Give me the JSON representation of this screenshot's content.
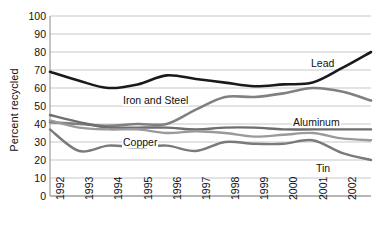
{
  "chart_data": {
    "type": "line",
    "title": "",
    "xlabel": "",
    "ylabel": "Percent recycled",
    "categories": [
      "1992",
      "1993",
      "1994",
      "1995",
      "1996",
      "1997",
      "1998",
      "1999",
      "2000",
      "2001",
      "2002",
      "2003"
    ],
    "x": [
      1992,
      1993,
      1994,
      1995,
      1996,
      1997,
      1998,
      1999,
      2000,
      2001,
      2002,
      2003
    ],
    "ylim": [
      0,
      100
    ],
    "ytick_step": 10,
    "yticks": [
      "100",
      "90",
      "80",
      "70",
      "60",
      "50",
      "40",
      "30",
      "20",
      "10",
      "0"
    ],
    "grid": "horizontal",
    "legend_position": "inline-annotations",
    "series": [
      {
        "name": "Lead",
        "color": "#1a1a1a",
        "width": 2.6,
        "values": [
          69,
          64,
          60,
          62,
          67,
          65,
          63,
          61,
          62,
          63,
          71,
          80
        ],
        "label": "Lead",
        "label_x": 310,
        "label_y": 58
      },
      {
        "name": "Iron and Steel",
        "color": "#808080",
        "width": 2.6,
        "values": [
          41,
          40,
          39,
          40,
          40,
          48,
          55,
          55,
          57,
          60,
          58,
          53
        ],
        "label": "Iron and Steel",
        "label_x": 122,
        "label_y": 95
      },
      {
        "name": "Aluminum",
        "color": "#6e6e6e",
        "width": 2.4,
        "values": [
          45,
          41,
          38,
          38,
          38,
          37,
          38,
          38,
          37,
          37,
          37,
          37
        ],
        "label": "Aluminum",
        "label_x": 292,
        "label_y": 117
      },
      {
        "name": "Copper",
        "color": "#9a9a9a",
        "width": 2.4,
        "values": [
          42,
          38,
          37,
          37,
          35,
          36,
          35,
          33,
          34,
          35,
          32,
          31
        ],
        "label": "Copper",
        "label_x": 122,
        "label_y": 137
      },
      {
        "name": "Tin",
        "color": "#7a7a7a",
        "width": 2.4,
        "values": [
          37,
          25,
          28,
          27,
          28,
          25,
          30,
          29,
          29,
          31,
          24,
          20
        ],
        "label": "Tin",
        "label_x": 315,
        "label_y": 163
      }
    ]
  },
  "plot": {
    "left": 50,
    "right": 371,
    "top": 16,
    "bottom": 196
  }
}
